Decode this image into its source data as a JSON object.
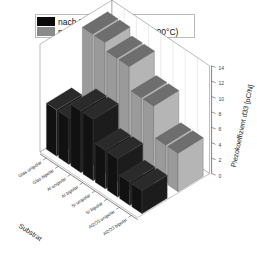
{
  "legend": {
    "items": [
      {
        "label": "nach Beschichtung",
        "color": "#0a0a0a"
      },
      {
        "label": "nach Temperung (4h bei 200°C)",
        "color": "#8a8a8a"
      }
    ]
  },
  "axes": {
    "x_title": "Substrat",
    "z_title": "Piezokoeffizient d33 [pC/N]",
    "z_ticks": [
      "0",
      "2",
      "4",
      "6",
      "8",
      "10",
      "12",
      "14"
    ]
  },
  "chart_data": {
    "type": "bar",
    "subtype": "3d-bar",
    "title": "",
    "xlabel": "Substrat",
    "ylabel": "Piezokoeffizient d33 [pC/N]",
    "ylim": [
      0,
      14
    ],
    "grid": true,
    "legend_position": "top-left",
    "categories": [
      "Glas unipolar",
      "Glas bipolar",
      "Al unipolar",
      "Al bipolar",
      "Si unipolar",
      "Si bipolar",
      "Al2O3 unipolar",
      "Al2O3 bipolar"
    ],
    "series": [
      {
        "name": "nach Beschichtung",
        "color": "#0a0a0a",
        "values": [
          6,
          6,
          8,
          8,
          5,
          5,
          3,
          3
        ]
      },
      {
        "name": "nach Temperung (4h bei 200°C)",
        "color": "#8a8a8a",
        "values": [
          13,
          13,
          12,
          12,
          9,
          9,
          5,
          5
        ]
      }
    ]
  }
}
